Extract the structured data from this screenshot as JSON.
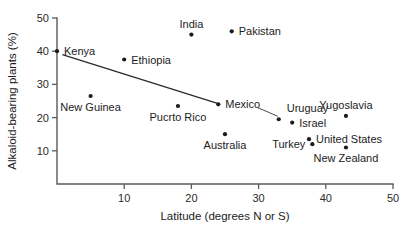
{
  "chart_data": {
    "type": "scatter",
    "title": "",
    "xlabel": "Latitude (degrees N or S)",
    "ylabel": "Alkaloid-bearing plants (%)",
    "xlim": [
      0,
      50
    ],
    "ylim": [
      0,
      50
    ],
    "xticks": [
      "10",
      "20",
      "30",
      "40",
      "50"
    ],
    "xtick_values": [
      10,
      20,
      30,
      40,
      50
    ],
    "yticks": [
      "10",
      "20",
      "30",
      "40",
      "50"
    ],
    "ytick_values": [
      10,
      20,
      30,
      40,
      50
    ],
    "grid": false,
    "legend": "none",
    "points": [
      {
        "label": "Kenya",
        "x": 0,
        "y": 40,
        "label_pos": "right"
      },
      {
        "label": "Ethiopia",
        "x": 10,
        "y": 37.5,
        "label_pos": "right"
      },
      {
        "label": "India",
        "x": 20,
        "y": 45,
        "label_pos": "above"
      },
      {
        "label": "Pakistan",
        "x": 26,
        "y": 46,
        "label_pos": "right"
      },
      {
        "label": "New Guinea",
        "x": 5,
        "y": 26.5,
        "label_pos": "below"
      },
      {
        "label": "Pucrto Rico",
        "x": 18,
        "y": 23.5,
        "label_pos": "below"
      },
      {
        "label": "Mexico",
        "x": 24,
        "y": 24,
        "label_pos": "right"
      },
      {
        "label": "Australia",
        "x": 25,
        "y": 15,
        "label_pos": "below"
      },
      {
        "label": "Uruguay",
        "x": 33,
        "y": 19.5,
        "label_pos": "above-leader"
      },
      {
        "label": "Israel",
        "x": 35,
        "y": 18.5,
        "label_pos": "right"
      },
      {
        "label": "United States",
        "x": 37.5,
        "y": 13.5,
        "label_pos": "right"
      },
      {
        "label": "Turkey",
        "x": 38,
        "y": 12,
        "label_pos": "left"
      },
      {
        "label": "Yugoslavia",
        "x": 43,
        "y": 20.5,
        "label_pos": "above"
      },
      {
        "label": "New Zealand",
        "x": 43,
        "y": 11,
        "label_pos": "below"
      }
    ],
    "trend_line": {
      "name": "regression-line",
      "x_start": 0.8,
      "y_start": 39,
      "x_end": 24,
      "y_end": 24.2
    }
  },
  "colors": {
    "axis": "#5a5a5a",
    "point": "#1c1c1c",
    "text": "#1c1c1c",
    "trend": "#2b2b2b",
    "background": "#ffffff"
  }
}
